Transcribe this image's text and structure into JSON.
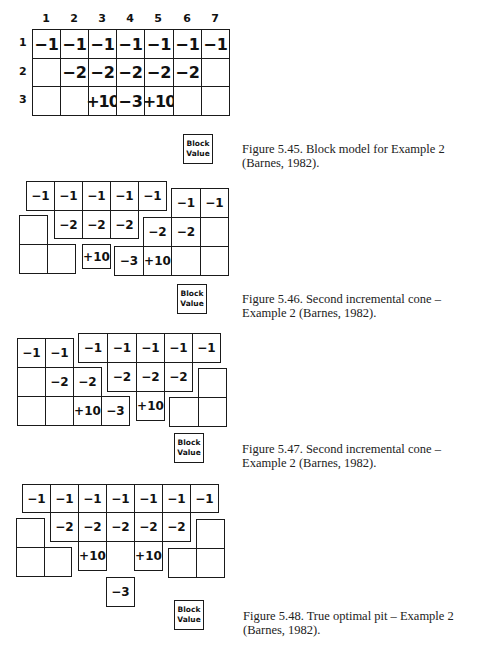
{
  "legend": {
    "line1": "Block",
    "line2": "Value"
  },
  "fig45": {
    "columns": [
      "1",
      "2",
      "3",
      "4",
      "5",
      "6",
      "7"
    ],
    "rows": [
      "1",
      "2",
      "3"
    ],
    "grid": [
      [
        "−1",
        "−1",
        "−1",
        "−1",
        "−1",
        "−1",
        "−1"
      ],
      [
        "",
        "−2",
        "−2",
        "−2",
        "−2",
        "−2",
        ""
      ],
      [
        "",
        "",
        "+10",
        "−3",
        "+10",
        "",
        ""
      ]
    ],
    "caption": "Figure 5.45.  Block model for Example 2 (Barnes, 1982)."
  },
  "fig46": {
    "cells": [
      "−1",
      "−1",
      "−1",
      "−1",
      "−1",
      "−2",
      "−2",
      "−2",
      "+10",
      "−1",
      "−1",
      "−2",
      "−2",
      "−3",
      "+10"
    ],
    "caption": "Figure 5.46.  Second incremental cone – Example 2 (Barnes, 1982)."
  },
  "fig47": {
    "cells": [
      "−1",
      "−1",
      "−2",
      "−2",
      "+10",
      "−3",
      "−1",
      "−1",
      "−1",
      "−1",
      "−1",
      "−2",
      "−2",
      "−2",
      "+10"
    ],
    "caption": "Figure 5.47.  Second incremental cone – Example 2 (Barnes, 1982)."
  },
  "fig48": {
    "cells": [
      "−1",
      "−1",
      "−1",
      "−1",
      "−1",
      "−1",
      "−1",
      "−2",
      "−2",
      "−2",
      "−2",
      "−2",
      "+10",
      "+10",
      "−3"
    ],
    "caption": "Figure 5.48.  True optimal pit – Example 2 (Barnes, 1982)."
  }
}
